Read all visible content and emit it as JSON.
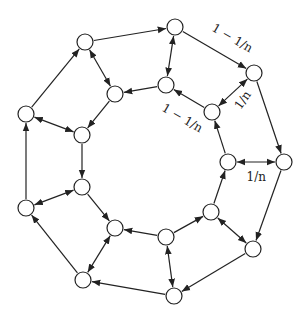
{
  "diagram": {
    "type": "directed-graph",
    "node_radius": 8,
    "stroke_color": "#222222",
    "node_fill": "#ffffff",
    "nodes": [
      {
        "id": "o1",
        "x": 175,
        "y": 27
      },
      {
        "id": "o2",
        "x": 254,
        "y": 73
      },
      {
        "id": "o3",
        "x": 284,
        "y": 162
      },
      {
        "id": "o4",
        "x": 253,
        "y": 249
      },
      {
        "id": "o5",
        "x": 174,
        "y": 296
      },
      {
        "id": "o6",
        "x": 83,
        "y": 280
      },
      {
        "id": "o7",
        "x": 26,
        "y": 208
      },
      {
        "id": "o8",
        "x": 26,
        "y": 114
      },
      {
        "id": "o9",
        "x": 85,
        "y": 42
      },
      {
        "id": "i1",
        "x": 166,
        "y": 85
      },
      {
        "id": "i2",
        "x": 212,
        "y": 112
      },
      {
        "id": "i3",
        "x": 228,
        "y": 162
      },
      {
        "id": "i4",
        "x": 211,
        "y": 212
      },
      {
        "id": "i5",
        "x": 166,
        "y": 237
      },
      {
        "id": "i6",
        "x": 115,
        "y": 228
      },
      {
        "id": "i7",
        "x": 82,
        "y": 187
      },
      {
        "id": "i8",
        "x": 82,
        "y": 135
      },
      {
        "id": "i9",
        "x": 115,
        "y": 94
      }
    ],
    "edges": [
      {
        "from": "o8",
        "to": "o9",
        "dir": "forward"
      },
      {
        "from": "o9",
        "to": "o1",
        "dir": "forward"
      },
      {
        "from": "o1",
        "to": "o2",
        "dir": "forward"
      },
      {
        "from": "o2",
        "to": "o3",
        "dir": "forward"
      },
      {
        "from": "o3",
        "to": "o4",
        "dir": "forward"
      },
      {
        "from": "o4",
        "to": "o5",
        "dir": "forward"
      },
      {
        "from": "o5",
        "to": "o6",
        "dir": "forward"
      },
      {
        "from": "o6",
        "to": "o7",
        "dir": "forward"
      },
      {
        "from": "o7",
        "to": "o8",
        "dir": "forward"
      },
      {
        "from": "o1",
        "to": "i1",
        "dir": "both"
      },
      {
        "from": "o9",
        "to": "i9",
        "dir": "both"
      },
      {
        "from": "o2",
        "to": "i2",
        "dir": "both"
      },
      {
        "from": "o3",
        "to": "i3",
        "dir": "both"
      },
      {
        "from": "o4",
        "to": "i4",
        "dir": "both"
      },
      {
        "from": "o5",
        "to": "i5",
        "dir": "both"
      },
      {
        "from": "o6",
        "to": "i6",
        "dir": "both"
      },
      {
        "from": "o7",
        "to": "i7",
        "dir": "both"
      },
      {
        "from": "o8",
        "to": "i8",
        "dir": "both"
      },
      {
        "from": "i2",
        "to": "i1",
        "dir": "forward"
      },
      {
        "from": "i1",
        "to": "i9",
        "dir": "forward"
      },
      {
        "from": "i9",
        "to": "i8",
        "dir": "forward"
      },
      {
        "from": "i8",
        "to": "i7",
        "dir": "forward"
      },
      {
        "from": "i7",
        "to": "i6",
        "dir": "forward"
      },
      {
        "from": "i5",
        "to": "i6",
        "dir": "forward"
      },
      {
        "from": "i5",
        "to": "i4",
        "dir": "forward"
      },
      {
        "from": "i4",
        "to": "i3",
        "dir": "forward"
      },
      {
        "from": "i3",
        "to": "i2",
        "dir": "forward"
      }
    ],
    "labels": [
      {
        "text": "1 − 1/n",
        "x": 232,
        "y": 38,
        "angle": 30
      },
      {
        "text": "1/n",
        "x": 242,
        "y": 100,
        "angle": -55
      },
      {
        "text": "1 − 1/n",
        "x": 182,
        "y": 118,
        "angle": 30
      },
      {
        "text": "1/n",
        "x": 256,
        "y": 177,
        "angle": 0
      }
    ]
  }
}
